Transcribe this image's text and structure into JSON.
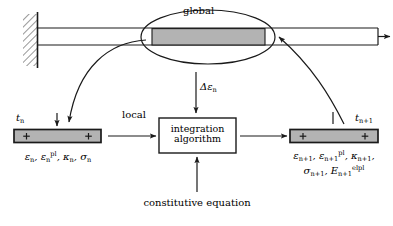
{
  "figure": {
    "type": "diagram"
  },
  "labels": {
    "global": "global",
    "local": "local",
    "strain_increment": "Δε",
    "strain_increment_sub": "n",
    "constitutive_equation": "constitutive equation",
    "box_line1": "integration",
    "box_line2": "algorithm",
    "time_n": "t",
    "time_n_sub": "n",
    "time_np1": "t",
    "time_np1_sub": "n+1"
  },
  "state_left": {
    "line1_items": [
      {
        "base": "ε",
        "sub": "n",
        "sup": ""
      },
      {
        "base": "ε",
        "sub": "n",
        "sup": "pl"
      },
      {
        "base": "κ",
        "sub": "n",
        "sup": ""
      },
      {
        "base": "σ",
        "sub": "n",
        "sup": ""
      }
    ],
    "line1_text": "εn, εn^pl, λn, σn"
  },
  "state_right": {
    "line1_items": [
      {
        "base": "ε",
        "sub": "n+1",
        "sup": ""
      },
      {
        "base": "ε",
        "sub": "n+1",
        "sup": "pl"
      },
      {
        "base": "κ",
        "sub": "n+1",
        "sup": ""
      }
    ],
    "line2_items": [
      {
        "base": "σ",
        "sub": "n+1",
        "sup": ""
      },
      {
        "base": "E",
        "sub": "n+1",
        "sup": "elpl"
      }
    ]
  },
  "colors": {
    "stroke": "#1a1a1a",
    "fill_gray": "#b3b3b3",
    "background": "#ffffff",
    "bar_fill": "#ffffff"
  },
  "elements": {
    "wall": "fixed-support-hatching",
    "top_bar": "elastic-bar",
    "highlight": "gauss-point-ellipse",
    "gray_segment": "integration-point-segment",
    "load_arrow": "applied-load-arrow",
    "left_bar": "state-bar-time-n",
    "right_bar": "state-bar-time-n-plus-1"
  }
}
